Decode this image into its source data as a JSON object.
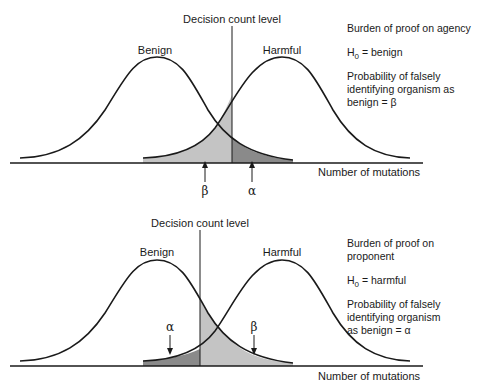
{
  "panels": [
    {
      "id": "top",
      "decision_label": "Decision count level",
      "curve_labels": {
        "left": "Benign",
        "right": "Harmful"
      },
      "axis_label": "Number of mutations",
      "arrows": [
        {
          "symbol": "β",
          "position": "left-of-decision"
        },
        {
          "symbol": "α",
          "position": "right-of-decision"
        }
      ],
      "notes": {
        "line1": "Burden of proof on agency",
        "h0_prefix": "H",
        "h0_sub": "0",
        "h0_rest": " = benign",
        "prob_line1": "Probability of falsely",
        "prob_line2": "identifying organism as",
        "prob_line3": "benign = β"
      },
      "shading": {
        "light": "#c4c4c4",
        "dark": "#8a8a8a"
      }
    },
    {
      "id": "bottom",
      "decision_label": "Decision count level",
      "curve_labels": {
        "left": "Benign",
        "right": "Harmful"
      },
      "axis_label": "Number of mutations",
      "arrows": [
        {
          "symbol": "α",
          "position": "left-of-decision"
        },
        {
          "symbol": "β",
          "position": "right-of-decision"
        }
      ],
      "notes": {
        "line1": "Burden of proof on",
        "line2": "proponent",
        "h0_prefix": "H",
        "h0_sub": "0",
        "h0_rest": " = harmful",
        "prob_line1": "Probability of falsely",
        "prob_line2": "identifying organism",
        "prob_line3": "as benign = α"
      },
      "shading": {
        "light": "#c4c4c4",
        "dark": "#8a8a8a"
      }
    }
  ]
}
